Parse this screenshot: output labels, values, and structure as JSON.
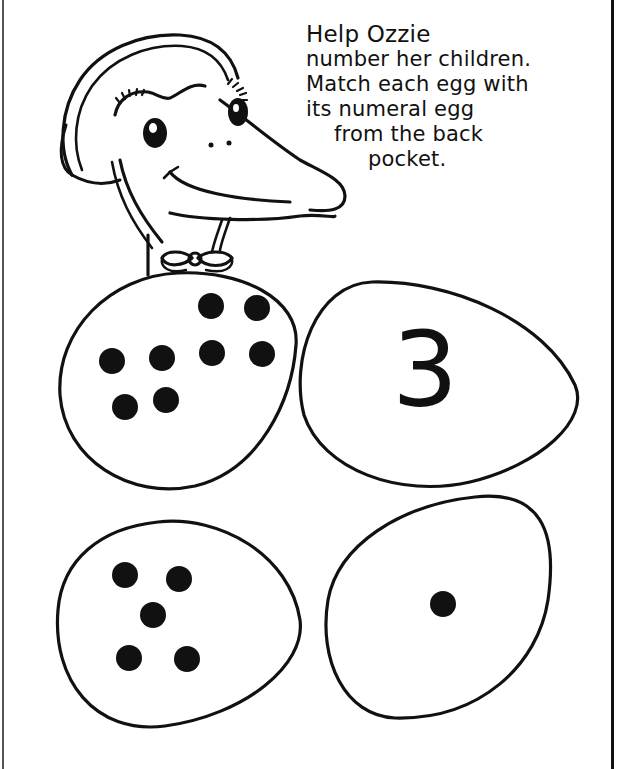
{
  "instructions": {
    "lines": [
      "Help Ozzie",
      "number her children.",
      "Match each egg with",
      "its numeral egg",
      "from the back",
      "pocket."
    ]
  },
  "character": {
    "name": "Ozzie",
    "icon": "duck-with-bonnet-icon"
  },
  "eggs": [
    {
      "position": "top-left",
      "type": "dots",
      "dot_count": 8
    },
    {
      "position": "top-right",
      "type": "numeral",
      "numeral": "3"
    },
    {
      "position": "bottom-left",
      "type": "dots",
      "dot_count": 5
    },
    {
      "position": "bottom-right",
      "type": "dots",
      "dot_count": 1
    }
  ],
  "colors": {
    "ink": "#111111",
    "paper": "#ffffff"
  }
}
